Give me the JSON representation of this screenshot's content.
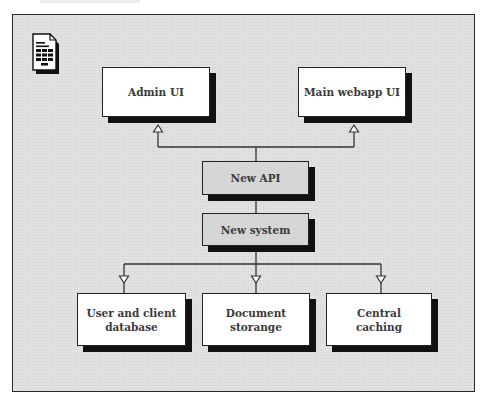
{
  "diagram": {
    "icon": "spreadsheet-document-icon",
    "top_row": [
      {
        "label": "Admin UI"
      },
      {
        "label": "Main webapp UI"
      }
    ],
    "middle": [
      {
        "label": "New API"
      },
      {
        "label": "New system"
      }
    ],
    "bottom_row": [
      {
        "line1": "User and client",
        "line2": "database"
      },
      {
        "line1": "Document",
        "line2": "storange"
      },
      {
        "line1": "Central",
        "line2": "caching"
      }
    ],
    "colors": {
      "background": "#e2e2e2",
      "box_white": "#ffffff",
      "box_grey": "#d6d6d6",
      "shadow": "#111111",
      "text": "#3a3a3a"
    }
  }
}
